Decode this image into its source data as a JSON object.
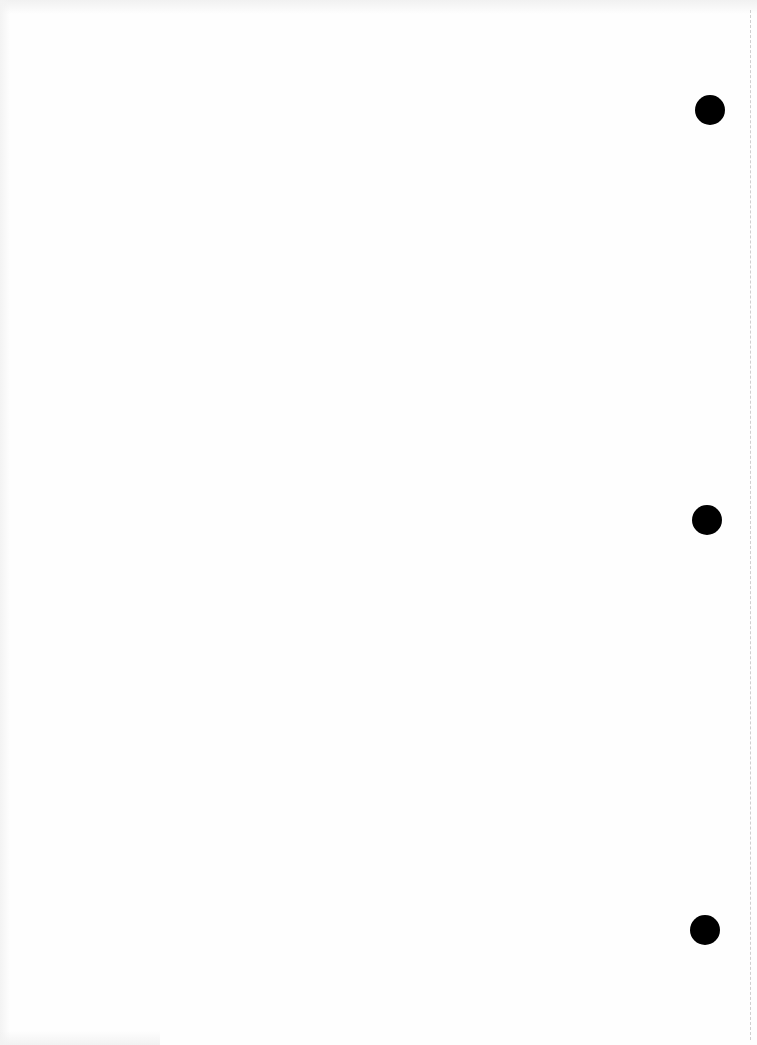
{
  "document": {
    "type": "blank scanned page",
    "background_color": "#fefefe",
    "text": ""
  },
  "punch_holes": [
    {
      "label": "top",
      "cx": 710,
      "cy": 110,
      "diameter": 30,
      "color": "#000000"
    },
    {
      "label": "middle",
      "cx": 707,
      "cy": 520,
      "diameter": 30,
      "color": "#000000"
    },
    {
      "label": "bottom",
      "cx": 705,
      "cy": 930,
      "diameter": 30,
      "color": "#000000"
    }
  ],
  "fold_line": {
    "x": 750,
    "style": "dashed",
    "color": "#cfcfcf"
  }
}
